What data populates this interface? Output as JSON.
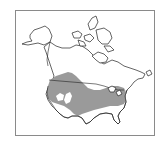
{
  "map": {
    "type": "species-range-map",
    "region": "North America",
    "legend": [],
    "colors": {
      "range_fill": "#9a9a9a",
      "land_fill": "#ffffff",
      "outline": "#222222",
      "frame": "#8a8a8a"
    },
    "features": [
      {
        "name": "Alaska",
        "shaded": false
      },
      {
        "name": "Canada",
        "shaded": false
      },
      {
        "name": "Canadian Arctic Archipelago",
        "shaded": false
      },
      {
        "name": "United States",
        "shaded": "mostly"
      },
      {
        "name": "Southern Canadian Prairies",
        "shaded": true
      }
    ]
  }
}
